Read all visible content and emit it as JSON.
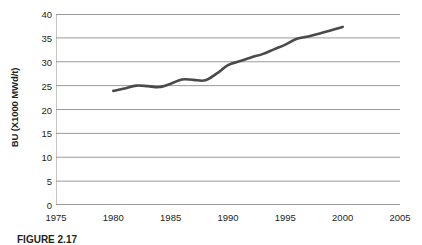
{
  "chart_data": {
    "type": "line",
    "title": "",
    "xlabel": "",
    "ylabel": "BU (X1000 MWd/t)",
    "xlim": [
      1975,
      2005
    ],
    "ylim": [
      0,
      40
    ],
    "grid": true,
    "grid_axis": "y",
    "legend": false,
    "line_color": "#4a4a4a",
    "line_width": 2.6,
    "x_ticks": [
      1975,
      1980,
      1985,
      1990,
      1995,
      2000,
      2005
    ],
    "x_tick_labels": [
      "1975",
      "1980",
      "1985",
      "1990",
      "1995",
      "2000",
      "2005"
    ],
    "y_ticks": [
      0,
      5,
      10,
      15,
      20,
      25,
      30,
      35,
      40
    ],
    "y_tick_labels": [
      "0",
      "5",
      "10",
      "15",
      "20",
      "25",
      "30",
      "35",
      "40"
    ],
    "series": [
      {
        "name": "Average discharge burnup",
        "x": [
          1980,
          1981,
          1982,
          1983,
          1984,
          1985,
          1986,
          1987,
          1988,
          1989,
          1990,
          1991,
          1992,
          1993,
          1994,
          1995,
          1996,
          1997,
          1998,
          1999,
          2000
        ],
        "values": [
          23.9,
          24.4,
          25.0,
          24.9,
          24.7,
          25.4,
          26.3,
          26.2,
          26.1,
          27.5,
          29.3,
          30.1,
          30.9,
          31.6,
          32.6,
          33.6,
          34.8,
          35.3,
          35.9,
          36.6,
          37.3
        ]
      }
    ]
  },
  "axis": {
    "y_title": "BU (X1000 MWd/t)"
  },
  "caption": {
    "label": "FIGURE 2.17",
    "text": ""
  }
}
